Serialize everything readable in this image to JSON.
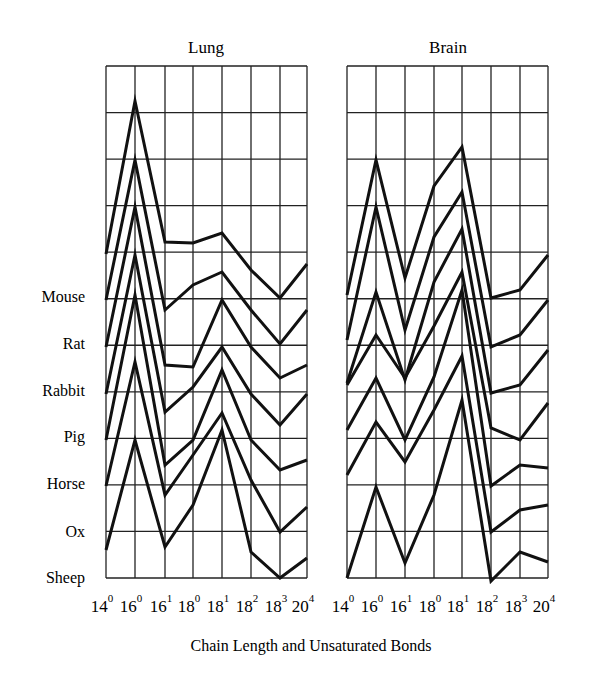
{
  "chart_data": [
    {
      "type": "line",
      "title": "Lung",
      "xlabel": "Chain Length and Unsaturated Bonds",
      "ylabel": "",
      "categories": [
        "14:0",
        "16:0",
        "16:1",
        "18:0",
        "18:1",
        "18:2",
        "18:3",
        "20:4"
      ],
      "category_labels": [
        {
          "base": "14",
          "sup": "0"
        },
        {
          "base": "16",
          "sup": "0"
        },
        {
          "base": "16",
          "sup": "1"
        },
        {
          "base": "18",
          "sup": "0"
        },
        {
          "base": "18",
          "sup": "1"
        },
        {
          "base": "18",
          "sup": "2"
        },
        {
          "base": "18",
          "sup": "3"
        },
        {
          "base": "20",
          "sup": "4"
        }
      ],
      "grid": true,
      "note": "Stacked/offset profiles, one per species; values are relative heights in grid units above each species baseline (estimated)",
      "series": [
        {
          "name": "Mouse",
          "pixel_y": [
            254,
            101,
            242,
            243,
            233,
            270,
            298,
            264
          ]
        },
        {
          "name": "Rat",
          "pixel_y": [
            300,
            160,
            310,
            285,
            272,
            310,
            344,
            310
          ]
        },
        {
          "name": "Rabbit",
          "pixel_y": [
            347,
            207,
            365,
            367,
            300,
            347,
            378,
            365
          ]
        },
        {
          "name": "Pig",
          "pixel_y": [
            394,
            255,
            412,
            387,
            347,
            394,
            425,
            394
          ]
        },
        {
          "name": "Horse",
          "pixel_y": [
            440,
            295,
            465,
            440,
            370,
            440,
            470,
            460
          ]
        },
        {
          "name": "Ox",
          "pixel_y": [
            486,
            362,
            495,
            455,
            413,
            480,
            532,
            507
          ]
        },
        {
          "name": "Sheep",
          "pixel_y": [
            550,
            440,
            547,
            505,
            430,
            552,
            578,
            558
          ]
        }
      ]
    },
    {
      "type": "line",
      "title": "Brain",
      "xlabel": "Chain Length and Unsaturated Bonds",
      "ylabel": "",
      "categories": [
        "14:0",
        "16:0",
        "16:1",
        "18:0",
        "18:1",
        "18:2",
        "18:3",
        "20:4"
      ],
      "category_labels": [
        {
          "base": "14",
          "sup": "0"
        },
        {
          "base": "16",
          "sup": "0"
        },
        {
          "base": "16",
          "sup": "1"
        },
        {
          "base": "18",
          "sup": "0"
        },
        {
          "base": "18",
          "sup": "1"
        },
        {
          "base": "18",
          "sup": "2"
        },
        {
          "base": "18",
          "sup": "3"
        },
        {
          "base": "20",
          "sup": "4"
        }
      ],
      "grid": true,
      "series": [
        {
          "name": "Mouse",
          "pixel_y": [
            295,
            160,
            278,
            186,
            147,
            298,
            290,
            255
          ]
        },
        {
          "name": "Rat",
          "pixel_y": [
            340,
            207,
            330,
            237,
            192,
            347,
            335,
            300
          ]
        },
        {
          "name": "Rabbit",
          "pixel_y": [
            383,
            292,
            380,
            282,
            229,
            393,
            385,
            350
          ]
        },
        {
          "name": "Pig",
          "pixel_y": [
            385,
            335,
            378,
            326,
            272,
            428,
            440,
            403
          ]
        },
        {
          "name": "Horse",
          "pixel_y": [
            430,
            378,
            440,
            377,
            290,
            486,
            465,
            468
          ]
        },
        {
          "name": "Ox",
          "pixel_y": [
            475,
            422,
            462,
            410,
            356,
            532,
            510,
            505
          ]
        },
        {
          "name": "Sheep",
          "pixel_y": [
            578,
            487,
            563,
            495,
            400,
            581,
            552,
            562
          ]
        }
      ]
    }
  ],
  "panels": [
    {
      "title": "Lung"
    },
    {
      "title": "Brain"
    }
  ],
  "species_labels": [
    "Mouse",
    "Rat",
    "Rabbit",
    "Pig",
    "Horse",
    "Ox",
    "Sheep"
  ],
  "x_axis_title": "Chain Length and Unsaturated Bonds",
  "colors": {
    "line": "#111111",
    "grid": "#222222",
    "background": "#ffffff"
  }
}
